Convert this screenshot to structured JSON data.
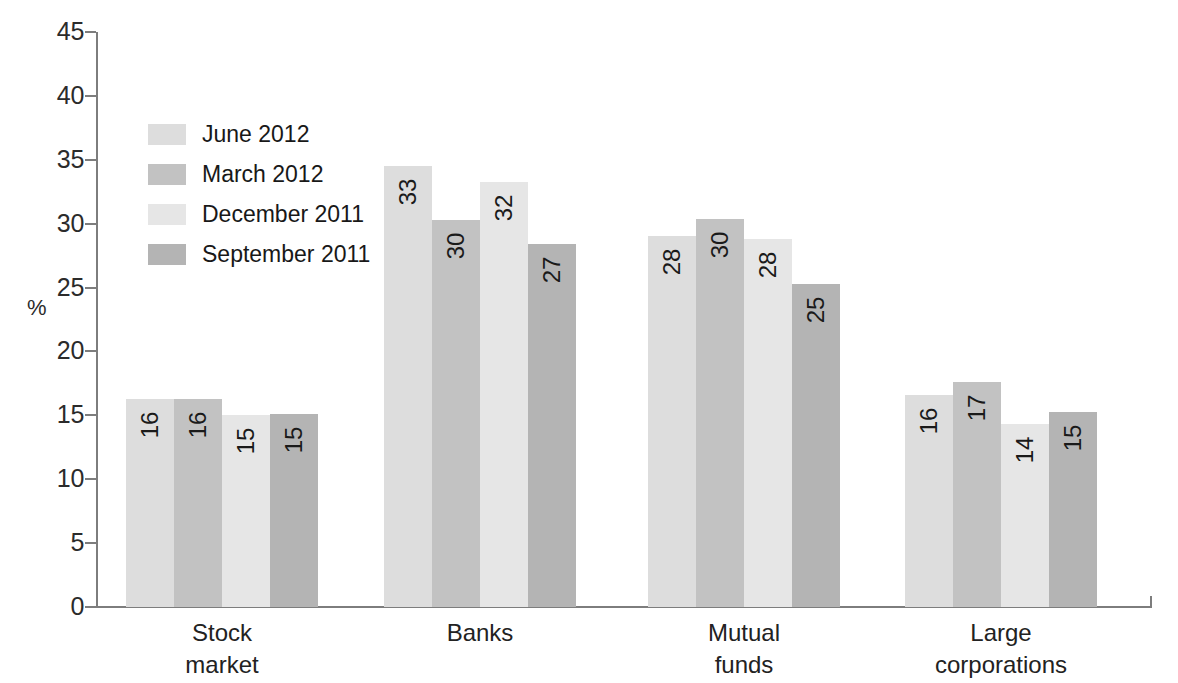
{
  "chart_data": {
    "type": "bar",
    "title": "",
    "subtitle": "",
    "xlabel": "",
    "ylabel": "%",
    "ylim": [
      0,
      45
    ],
    "ytick_step": 5,
    "yticks": [
      0,
      5,
      10,
      15,
      20,
      25,
      30,
      35,
      40,
      45
    ],
    "grid": false,
    "legend_position": "upper-left-inside",
    "categories": [
      "Stock\nmarket",
      "Banks",
      "Mutual\nfunds",
      "Large\ncorporations"
    ],
    "categories_plain": [
      "Stock market",
      "Banks",
      "Mutual funds",
      "Large corporations"
    ],
    "series": [
      {
        "name": "June 2012",
        "color": "#dddddd",
        "values": [
          16,
          33,
          28,
          16
        ],
        "plotted": [
          16.3,
          34.5,
          29.0,
          16.6
        ]
      },
      {
        "name": "March 2012",
        "color": "#c2c2c2",
        "values": [
          16,
          30,
          30,
          17
        ],
        "plotted": [
          16.3,
          30.3,
          30.4,
          17.6
        ]
      },
      {
        "name": "December 2011",
        "color": "#e6e6e6",
        "values": [
          15,
          32,
          28,
          14
        ],
        "plotted": [
          15.0,
          33.3,
          28.8,
          14.3
        ]
      },
      {
        "name": "September 2011",
        "color": "#b4b4b4",
        "values": [
          15,
          27,
          25,
          15
        ],
        "plotted": [
          15.1,
          28.4,
          25.3,
          15.3
        ]
      }
    ]
  },
  "axis": {
    "percent_label": "%"
  },
  "colors": {
    "axis_line": "#7d7d7d",
    "tick_text": "#2b2b2b",
    "value_text": "#1a1a1a",
    "background": "#ffffff"
  }
}
